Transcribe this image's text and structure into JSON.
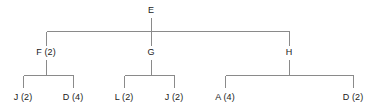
{
  "diagram": {
    "type": "hierarchy-tree",
    "line_color": "#8a8a8a",
    "text_color": "#1a1a1a",
    "background_color": "#ffffff",
    "nodes": [
      {
        "id": "E",
        "label": "E",
        "letter": "E",
        "count": null,
        "level": 0,
        "x": 151,
        "y": 10
      },
      {
        "id": "F",
        "label": "F (2)",
        "letter": "F",
        "count": 2,
        "level": 1,
        "x": 46,
        "y": 52
      },
      {
        "id": "G",
        "label": "G",
        "letter": "G",
        "count": null,
        "level": 1,
        "x": 151,
        "y": 52
      },
      {
        "id": "H",
        "label": "H",
        "letter": "H",
        "count": null,
        "level": 1,
        "x": 289,
        "y": 52
      },
      {
        "id": "F1",
        "label": "J (2)",
        "letter": "J",
        "count": 2,
        "level": 2,
        "x": 23,
        "y": 95
      },
      {
        "id": "F2",
        "label": "D (4)",
        "letter": "D",
        "count": 4,
        "level": 2,
        "x": 73,
        "y": 95
      },
      {
        "id": "G1",
        "label": "L (2)",
        "letter": "L",
        "count": 2,
        "level": 2,
        "x": 124,
        "y": 95
      },
      {
        "id": "G2",
        "label": "J (2)",
        "letter": "J",
        "count": 2,
        "level": 2,
        "x": 174,
        "y": 95
      },
      {
        "id": "H1",
        "label": "A (4)",
        "letter": "A",
        "count": 4,
        "level": 2,
        "x": 225,
        "y": 95
      },
      {
        "id": "H2",
        "label": "D (2)",
        "letter": "D",
        "count": 2,
        "level": 2,
        "x": 353,
        "y": 95
      }
    ],
    "edges": [
      {
        "from": "E",
        "to": "F"
      },
      {
        "from": "E",
        "to": "G"
      },
      {
        "from": "E",
        "to": "H"
      },
      {
        "from": "F",
        "to": "F1"
      },
      {
        "from": "F",
        "to": "F2"
      },
      {
        "from": "G",
        "to": "G1"
      },
      {
        "from": "G",
        "to": "G2"
      },
      {
        "from": "H",
        "to": "H1"
      },
      {
        "from": "H",
        "to": "H2"
      }
    ]
  }
}
